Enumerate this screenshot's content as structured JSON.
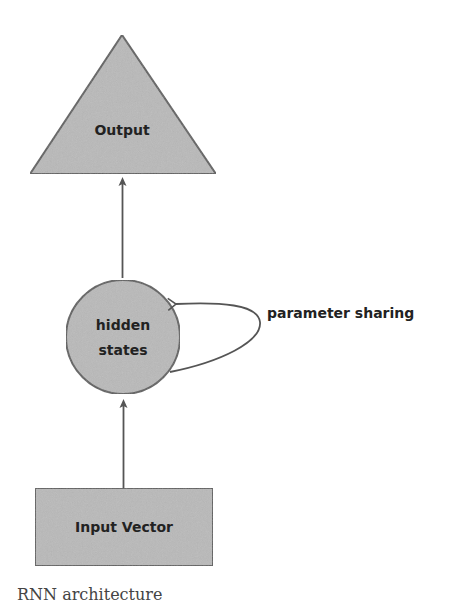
{
  "diagram": {
    "title": "RNN architecture",
    "nodes": {
      "output": {
        "label": "Output",
        "shape": "triangle"
      },
      "hidden": {
        "label_line1": "hidden",
        "label_line2": "states",
        "shape": "circle"
      },
      "input": {
        "label": "Input Vector",
        "shape": "rectangle"
      }
    },
    "edges": [
      {
        "from": "input",
        "to": "hidden"
      },
      {
        "from": "hidden",
        "to": "output"
      },
      {
        "from": "hidden",
        "to": "hidden",
        "label": "parameter sharing"
      }
    ],
    "loop_label": "parameter sharing",
    "caption": "RNN architecture",
    "colors": {
      "node_fill": "#b9b9b9",
      "node_stroke": "#5f5f5f",
      "edge": "#555555",
      "text": "#222222"
    }
  }
}
